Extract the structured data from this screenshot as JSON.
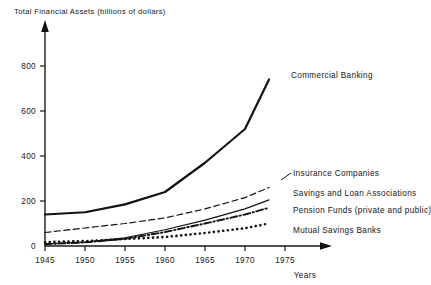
{
  "chart_data": {
    "type": "line",
    "title": "Total Financial Assets (billions of dollars)",
    "xlabel": "Years",
    "ylabel": "",
    "xlim": [
      1945,
      1977
    ],
    "ylim": [
      0,
      870
    ],
    "grid": false,
    "legend_position": "inline-right-of-series-ends",
    "x_ticks": [
      1945,
      1950,
      1955,
      1960,
      1965,
      1970,
      1975
    ],
    "x_tick_labels": [
      "1945",
      "1950",
      "1955",
      "1960",
      "1965",
      "1970",
      "1975"
    ],
    "y_ticks": [
      0,
      200,
      400,
      600,
      800
    ],
    "y_tick_labels": [
      "0",
      "200",
      "400",
      "600",
      "800"
    ],
    "x": [
      1945,
      1950,
      1955,
      1960,
      1965,
      1970,
      1973
    ],
    "series": [
      {
        "name": "Commercial Banking",
        "label": "Commercial Banking",
        "style": "solid-thick",
        "values": [
          140,
          150,
          185,
          240,
          370,
          520,
          740
        ]
      },
      {
        "name": "Insurance Companies",
        "label": "Insurance Companies",
        "style": "dashed",
        "values": [
          60,
          80,
          100,
          125,
          165,
          215,
          260
        ]
      },
      {
        "name": "Savings and Loan Associations",
        "label": "Savings and Loan Associations",
        "style": "solid-thin",
        "values": [
          10,
          18,
          37,
          72,
          115,
          165,
          205
        ]
      },
      {
        "name": "Pension Funds (private and public)",
        "label": "Pension Funds (private and public)",
        "style": "dash-dot",
        "values": [
          8,
          16,
          32,
          62,
          100,
          140,
          170
        ]
      },
      {
        "name": "Mutual Savings Banks",
        "label": "Mutual Savings Banks",
        "style": "dotted",
        "values": [
          17,
          22,
          31,
          40,
          58,
          79,
          100
        ]
      }
    ]
  },
  "labels": {
    "title": "Total Financial Assets (billions of dollars)",
    "years_caption": "Years",
    "y_ticks": [
      "800",
      "600",
      "400",
      "200",
      "0"
    ],
    "x_ticks": [
      "1945",
      "1950",
      "1955",
      "1960",
      "1965",
      "1970",
      "1975"
    ],
    "series": [
      "Commercial Banking",
      "Insurance Companies",
      "Savings and Loan Associations",
      "Pension Funds (private and public)",
      "Mutual Savings Banks"
    ]
  },
  "colors": {
    "ink": "#121212",
    "background": "#ffffff"
  }
}
